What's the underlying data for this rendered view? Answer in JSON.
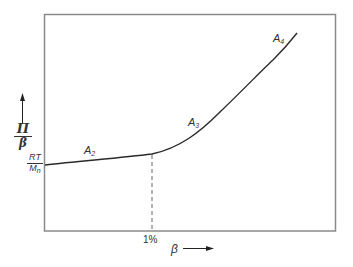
{
  "diagram": {
    "y_axis": {
      "label_num": "Π",
      "label_den": "β",
      "intercept_num": "RT",
      "intercept_den_base": "M",
      "intercept_den_sub": "n"
    },
    "x_axis": {
      "label": "β",
      "tick_label": "1%"
    },
    "regions": [
      {
        "base": "A",
        "sub": "2"
      },
      {
        "base": "A",
        "sub": "3"
      },
      {
        "base": "A",
        "sub": "4"
      }
    ],
    "colors": {
      "line": "#2a2a2a",
      "frame": "#888888"
    }
  }
}
